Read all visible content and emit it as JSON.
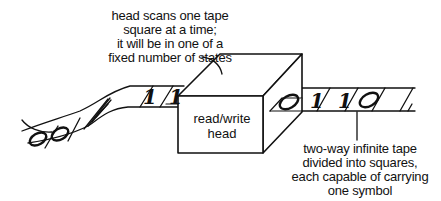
{
  "diagram": {
    "head_caption": {
      "lines": [
        "head scans one tape",
        "square at a time;",
        "it will be in one of a",
        "fixed number of states"
      ]
    },
    "box_label": {
      "lines": [
        "read/write",
        "head"
      ]
    },
    "tape_caption": {
      "lines": [
        "two-way infinite tape",
        "divided into squares,",
        "each capable of carrying",
        "one symbol"
      ]
    },
    "tape_symbols_left": [
      "0",
      "0",
      "1",
      "1"
    ],
    "tape_symbols_right": [
      "0",
      "1",
      "1",
      "0"
    ],
    "colors": {
      "ink": "#111111",
      "background": "#ffffff"
    }
  }
}
